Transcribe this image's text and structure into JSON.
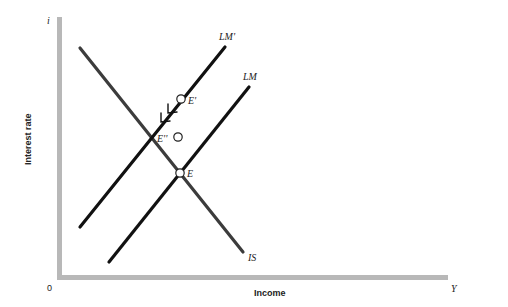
{
  "diagram": {
    "type": "IS-LM",
    "axes": {
      "y_symbol": "i",
      "y_label": "Interest rate",
      "x_symbol": "Y",
      "x_label": "Income",
      "origin": "0",
      "axis_color": "#b4b4b4"
    },
    "curves": {
      "is": {
        "label": "IS",
        "color": "#3c3c3c"
      },
      "lm": {
        "label": "LM",
        "color": "#111111"
      },
      "lm_prime": {
        "label": "LM'",
        "color": "#111111"
      }
    },
    "points": {
      "e": {
        "label": "E"
      },
      "e_prime": {
        "label": "E'"
      },
      "e_double_prime": {
        "label": "E''"
      }
    },
    "annotation": "Arrows along LM' indicate movement from E' down to E''"
  }
}
